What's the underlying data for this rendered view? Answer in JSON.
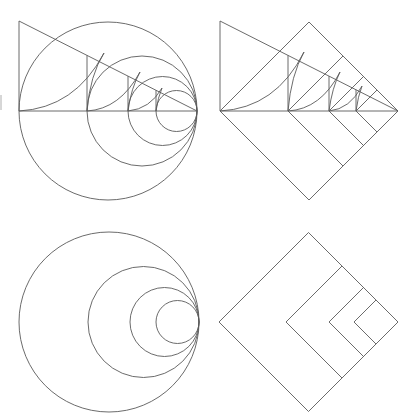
{
  "figure": {
    "width": 415,
    "height": 419,
    "line_color": "#5a5a5a",
    "background": "#ffffff"
  },
  "panels": {
    "top_left": {
      "name": "circles-with-triangle-construction",
      "triangle": {
        "apex": [
          19,
          21
        ],
        "base_left": [
          19,
          111
        ],
        "base_right": [
          197,
          111
        ]
      },
      "tangent_point": [
        197,
        111
      ],
      "circle_left_edges": [
        19,
        87,
        128,
        156
      ],
      "verticals": [
        87,
        128,
        156
      ],
      "arcs": [
        {
          "from": [
            19,
            111
          ],
          "to": [
            104,
            53
          ],
          "ctrl": [
            75,
            108
          ]
        },
        {
          "from": [
            87,
            111
          ],
          "to": [
            104,
            53
          ],
          "ctrl": [
            90,
            75
          ]
        },
        {
          "from": [
            87,
            111
          ],
          "to": [
            140,
            72
          ],
          "ctrl": [
            120,
            109
          ]
        },
        {
          "from": [
            128,
            111
          ],
          "to": [
            140,
            72
          ],
          "ctrl": [
            131,
            88
          ]
        },
        {
          "from": [
            128,
            111
          ],
          "to": [
            162,
            88
          ],
          "ctrl": [
            150,
            109
          ]
        },
        {
          "from": [
            156,
            111
          ],
          "to": [
            162,
            88
          ],
          "ctrl": [
            158,
            97
          ]
        }
      ]
    },
    "top_right": {
      "name": "squares-with-triangle-construction",
      "triangle": {
        "apex": [
          220,
          21
        ],
        "base_left": [
          220,
          111
        ],
        "base_right": [
          398,
          111
        ]
      },
      "right_vertex": [
        398,
        111
      ],
      "square_left_vertices": [
        220,
        288,
        329,
        356
      ],
      "verticals": [
        288,
        329,
        356
      ],
      "arcs": [
        {
          "from": [
            220,
            111
          ],
          "to": [
            304,
            52
          ],
          "ctrl": [
            276,
            108
          ]
        },
        {
          "from": [
            288,
            111
          ],
          "to": [
            304,
            52
          ],
          "ctrl": [
            291,
            75
          ]
        },
        {
          "from": [
            288,
            111
          ],
          "to": [
            340,
            72
          ],
          "ctrl": [
            321,
            109
          ]
        },
        {
          "from": [
            329,
            111
          ],
          "to": [
            340,
            72
          ],
          "ctrl": [
            332,
            88
          ]
        },
        {
          "from": [
            329,
            111
          ],
          "to": [
            362,
            86
          ],
          "ctrl": [
            350,
            109
          ]
        },
        {
          "from": [
            356,
            111
          ],
          "to": [
            362,
            86
          ],
          "ctrl": [
            358,
            96
          ]
        }
      ]
    },
    "bottom_left": {
      "name": "nested-tangent-circles",
      "tangent_point": [
        199,
        322
      ],
      "circle_left_edges": [
        19,
        88,
        130,
        156
      ]
    },
    "bottom_right": {
      "name": "nested-diamonds",
      "right_vertex": [
        398,
        322
      ],
      "square_left_vertices": [
        219,
        286,
        329,
        354
      ]
    }
  },
  "artifact": {
    "x": 1,
    "y1": 95,
    "y2": 110
  }
}
